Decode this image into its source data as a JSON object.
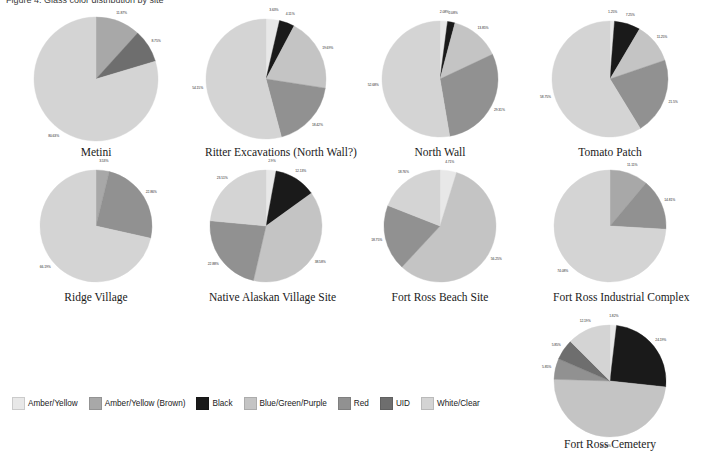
{
  "header": {
    "text": "Figure 4. Glass color distribution by site"
  },
  "legend": {
    "items": [
      {
        "label": "Amber/Yellow",
        "color": "#e8e8e8"
      },
      {
        "label": "Amber/Yellow (Brown)",
        "color": "#a8a8a8"
      },
      {
        "label": "Black",
        "color": "#1a1a1a"
      },
      {
        "label": "Blue/Green/Purple",
        "color": "#c4c4c4"
      },
      {
        "label": "Red",
        "color": "#919191"
      },
      {
        "label": "UID",
        "color": "#6e6e6e"
      },
      {
        "label": "White/Clear",
        "color": "#d4d4d4"
      }
    ]
  },
  "chart_data": [
    {
      "type": "pie",
      "title": "Metini",
      "categories": [
        "Amber/Yellow (Brown)",
        "UID",
        "White/Clear"
      ],
      "values": [
        11.87,
        8.75,
        80.63
      ],
      "labels": [
        "11.87%",
        "8.75%",
        "80.63%"
      ],
      "colors": [
        "#a8a8a8",
        "#6e6e6e",
        "#d4d4d4"
      ]
    },
    {
      "type": "pie",
      "title": "Ritter Excavations (North Wall?)",
      "categories": [
        "Amber/Yellow",
        "Black",
        "Blue/Green/Purple",
        "UID",
        "White/Clear"
      ],
      "values": [
        3.63,
        4.11,
        19.69,
        18.42,
        54.15
      ],
      "labels": [
        "3.63%",
        "4.11%",
        "19.69%",
        "18.42%",
        "54.15%"
      ],
      "colors": [
        "#e8e8e8",
        "#1a1a1a",
        "#c4c4c4",
        "#919191",
        "#d4d4d4"
      ]
    },
    {
      "type": "pie",
      "title": "North Wall",
      "categories": [
        "Amber/Yellow",
        "Black",
        "Blue/Green/Purple",
        "UID",
        "White/Clear"
      ],
      "values": [
        2.08,
        2.08,
        13.85,
        29.31,
        52.68
      ],
      "labels": [
        "2.08%",
        "2.08%",
        "13.85%",
        "29.31%",
        "52.68%"
      ],
      "colors": [
        "#e8e8e8",
        "#1a1a1a",
        "#c4c4c4",
        "#919191",
        "#d4d4d4"
      ]
    },
    {
      "type": "pie",
      "title": "Tomato Patch",
      "categories": [
        "Amber/Yellow",
        "Black",
        "Blue/Green/Purple",
        "UID",
        "White/Clear"
      ],
      "values": [
        1.25,
        7.25,
        11.25,
        21.5,
        58.75
      ],
      "labels": [
        "1.25%",
        "7.25%",
        "11.25%",
        "21.5%",
        "58.75%"
      ],
      "colors": [
        "#e8e8e8",
        "#1a1a1a",
        "#c4c4c4",
        "#919191",
        "#d4d4d4"
      ]
    },
    {
      "type": "pie",
      "title": "Ridge Village",
      "categories": [
        "Amber/Yellow (Brown)",
        "UID",
        "White/Clear"
      ],
      "values": [
        3.53,
        22.86,
        66.19
      ],
      "labels": [
        "3.53%",
        "22.86%",
        "66.19%"
      ],
      "colors": [
        "#a8a8a8",
        "#919191",
        "#d4d4d4"
      ]
    },
    {
      "type": "pie",
      "title": "Native Alaskan Village Site",
      "categories": [
        "Amber/Yellow",
        "Black",
        "Blue/Green/Purple",
        "UID",
        "White/Clear"
      ],
      "values": [
        2.9,
        12.13,
        38.58,
        22.88,
        23.51
      ],
      "labels": [
        "2.9%",
        "12.13%",
        "38.58%",
        "22.88%",
        "23.51%"
      ],
      "colors": [
        "#e8e8e8",
        "#1a1a1a",
        "#c4c4c4",
        "#919191",
        "#d4d4d4"
      ]
    },
    {
      "type": "pie",
      "title": "Fort Ross Beach Site",
      "categories": [
        "Amber/Yellow",
        "Blue/Green/Purple",
        "UID",
        "White/Clear"
      ],
      "values": [
        4.71,
        56.25,
        18.75,
        18.76
      ],
      "labels": [
        "4.71%",
        "56.25%",
        "18.75%",
        "18.76%"
      ],
      "colors": [
        "#e8e8e8",
        "#c4c4c4",
        "#919191",
        "#d4d4d4"
      ]
    },
    {
      "type": "pie",
      "title": "Fort Ross Industrial Complex",
      "categories": [
        "Amber/Yellow (Brown)",
        "UID",
        "White/Clear"
      ],
      "values": [
        11.11,
        14.81,
        74.08
      ],
      "labels": [
        "11.11%",
        "14.81%",
        "74.08%"
      ],
      "colors": [
        "#a8a8a8",
        "#919191",
        "#d4d4d4"
      ]
    },
    {
      "type": "pie",
      "title": "Fort Ross Cemetery",
      "categories": [
        "Amber/Yellow",
        "Black",
        "Blue/Green/Purple",
        "Red",
        "UID",
        "White/Clear"
      ],
      "values": [
        1.82,
        24.19,
        47.55,
        5.85,
        5.85,
        12.19
      ],
      "labels": [
        "1.82%",
        "24.19%",
        "47.55%",
        "5.85%",
        "5.85%",
        "12.19%"
      ],
      "colors": [
        "#e8e8e8",
        "#1a1a1a",
        "#c4c4c4",
        "#919191",
        "#6e6e6e",
        "#d4d4d4"
      ]
    }
  ],
  "layout": {
    "positions": [
      {
        "cx": 96,
        "cy": 79,
        "r": 62,
        "titleY": 146
      },
      {
        "cx": 266,
        "cy": 79,
        "r": 60,
        "titleY": 146
      },
      {
        "cx": 440,
        "cy": 79,
        "r": 58,
        "titleY": 146
      },
      {
        "cx": 610,
        "cy": 79,
        "r": 58,
        "titleY": 146
      },
      {
        "cx": 96,
        "cy": 226,
        "r": 56,
        "titleY": 291
      },
      {
        "cx": 266,
        "cy": 226,
        "r": 56,
        "titleY": 291
      },
      {
        "cx": 440,
        "cy": 226,
        "r": 56,
        "titleY": 291
      },
      {
        "cx": 610,
        "cy": 226,
        "r": 56,
        "titleY": 291
      },
      {
        "cx": 610,
        "cy": 381,
        "r": 56,
        "titleY": 438
      }
    ]
  }
}
